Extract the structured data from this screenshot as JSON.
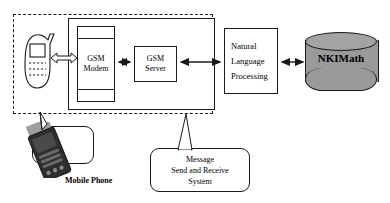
{
  "diagram": {
    "type": "block-architecture",
    "background_color": "#ffffff",
    "line_color": "#1a1a1a",
    "database_fill": "#9a9a9a"
  },
  "boundary": {
    "name": "system-boundary",
    "style": "dashed",
    "encloses": [
      "mobile-phone-icon",
      "gsm-modem",
      "gsm-server"
    ]
  },
  "group": {
    "name": "message-send-receive-group",
    "style": "solid",
    "encloses": [
      "gsm-modem",
      "gsm-server"
    ]
  },
  "nodes": {
    "phone_icon": {
      "label": "",
      "kind": "mobile-phone-illustration"
    },
    "modem": {
      "line1": "GSM",
      "line2": "Modem",
      "kind": "device-box"
    },
    "server": {
      "line1": "GSM",
      "line2": "Server",
      "kind": "process-box"
    },
    "nlp": {
      "line1": "Natural",
      "line2": "Language",
      "line3": "Processing",
      "kind": "process-box"
    },
    "database": {
      "label": "NKIMath",
      "kind": "database-cylinder"
    }
  },
  "callouts": {
    "mobile_phone": {
      "label": "Mobile Phone",
      "points_to": "mobile-phone-icon"
    },
    "message_system": {
      "line1": "Message",
      "line2": "Send and Receive",
      "line3": "System",
      "points_to": "message-send-receive-group"
    }
  },
  "connections": [
    {
      "from": "mobile-phone-icon",
      "to": "gsm-modem",
      "arrow": "double",
      "style": "hollow-block"
    },
    {
      "from": "gsm-modem",
      "to": "gsm-server",
      "arrow": "double",
      "style": "solid"
    },
    {
      "from": "gsm-server",
      "to": "natural-language-processing",
      "arrow": "double",
      "style": "solid"
    },
    {
      "from": "natural-language-processing",
      "to": "nkimath-database",
      "arrow": "double",
      "style": "solid"
    }
  ]
}
